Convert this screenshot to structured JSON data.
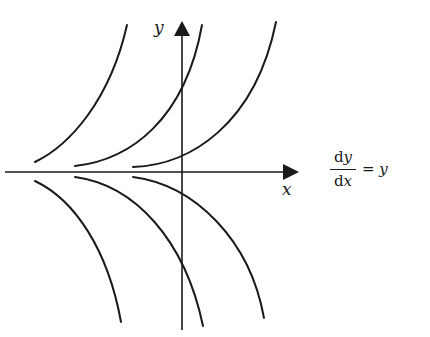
{
  "diagram": {
    "axes": {
      "x_label": "x",
      "y_label": "y"
    },
    "equation": {
      "numerator_d": "d",
      "numerator_var": "y",
      "denominator_d": "d",
      "denominator_var": "x",
      "equals": "=",
      "rhs": "y"
    },
    "curves": [
      {
        "name": "upper-curve-1",
        "path": "M35,162 C70,145 110,100 127,25"
      },
      {
        "name": "upper-curve-2",
        "path": "M75,166 C130,160 185,120 202,25"
      },
      {
        "name": "upper-curve-3",
        "path": "M133,167 C190,165 255,125 276,22"
      },
      {
        "name": "lower-curve-1",
        "path": "M35,181 C75,200 108,250 121,322"
      },
      {
        "name": "lower-curve-2",
        "path": "M75,177 C135,185 185,240 203,326"
      },
      {
        "name": "lower-curve-3",
        "path": "M133,177 C195,185 250,240 264,318"
      }
    ],
    "colors": {
      "stroke": "#1a1a1a",
      "background": "#ffffff"
    }
  }
}
